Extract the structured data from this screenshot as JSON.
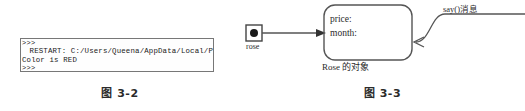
{
  "figure_2": {
    "caption": "图 3-2",
    "console": {
      "lines": [
        ">>>",
        " RESTART: C:/Users/Queena/AppData/Local/P",
        "Color is RED",
        ">>>"
      ],
      "line_1": ">>>",
      "line_2": " RESTART: C:/Users/Queena/AppData/Local/P",
      "line_3": "Color is RED",
      "line_4": ">>>"
    }
  },
  "figure_3": {
    "caption": "图 3-3",
    "reference": {
      "label": "rose"
    },
    "object": {
      "attributes": [
        "price:",
        "month:"
      ],
      "attribute_price": "price:",
      "attribute_month": "month:",
      "caption": "Rose 的对象"
    },
    "message": {
      "label": "say()消息"
    }
  },
  "colors": {
    "stroke": "#555555",
    "box_border": "#777777",
    "text": "#2b2b2b",
    "background": "#ffffff"
  }
}
